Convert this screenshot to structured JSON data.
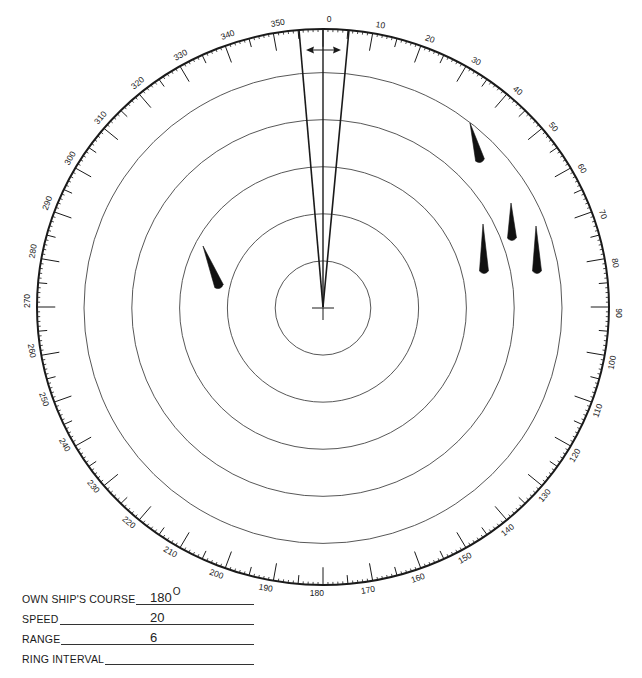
{
  "figure": {
    "type": "radar plotting sheet",
    "bearing_labels": [
      "0",
      "10",
      "20",
      "30",
      "40",
      "50",
      "60",
      "70",
      "80",
      "90",
      "100",
      "110",
      "120",
      "130",
      "140",
      "150",
      "160",
      "170",
      "180",
      "190",
      "200",
      "210",
      "220",
      "230",
      "240",
      "250",
      "260",
      "270",
      "280",
      "290",
      "300",
      "310",
      "320",
      "330",
      "340",
      "350"
    ],
    "range_rings": 5,
    "heading_marker": {
      "description": "own ship heading flasher",
      "arrow": "double-headed"
    },
    "targets": [
      {
        "id": "A",
        "from": [
          470,
          123
        ],
        "to": [
          480,
          160
        ]
      },
      {
        "id": "B",
        "from": [
          511,
          203
        ],
        "to": [
          512,
          238
        ]
      },
      {
        "id": "C",
        "from": [
          483,
          224
        ],
        "to": [
          484,
          271
        ]
      },
      {
        "id": "D",
        "from": [
          536,
          226
        ],
        "to": [
          537,
          271
        ]
      },
      {
        "id": "E",
        "from": [
          203,
          246
        ],
        "to": [
          219,
          286
        ]
      }
    ],
    "colors": {
      "ink": "#1a1a1a",
      "ring": "#444444",
      "background": "#ffffff"
    }
  },
  "form": {
    "course_label": "OWN SHIP'S COURSE",
    "course_value": "180",
    "course_unit": "O",
    "speed_label": "SPEED",
    "speed_value": "20",
    "range_label": "RANGE",
    "range_value": "6",
    "ring_interval_label": "RING INTERVAL",
    "ring_interval_value": ""
  }
}
